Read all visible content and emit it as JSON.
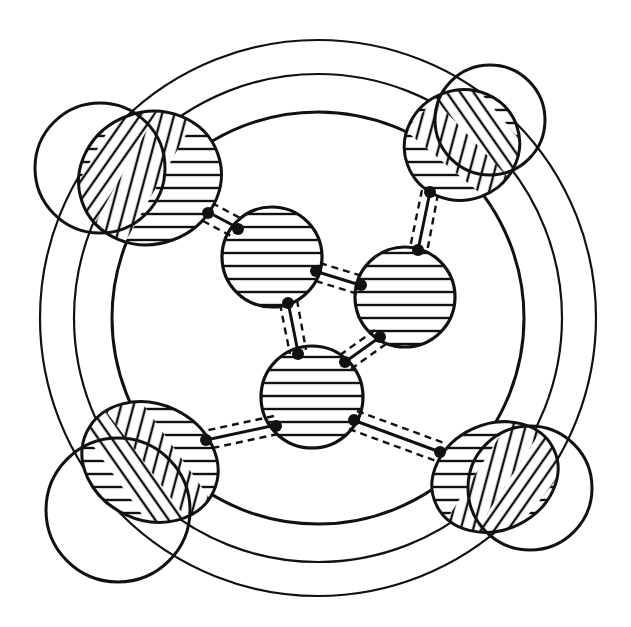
{
  "figure": {
    "description": "Patent-style line drawing: three concentric rings enclosing a cluster of four hatched circles joined by double dashed bonds, with four hatched lobes at the ring's corners",
    "colors": {
      "ink": "#111111",
      "background": "#ffffff"
    },
    "rings": [
      {
        "name": "outer-ring",
        "cx": 318,
        "cy": 318,
        "r": 278
      },
      {
        "name": "middle-ring",
        "cx": 318,
        "cy": 318,
        "r": 244
      },
      {
        "name": "inner-ring",
        "cx": 318,
        "cy": 318,
        "r": 206
      }
    ],
    "core_nodes": [
      {
        "name": "node-upper-left",
        "cx": 272,
        "cy": 257,
        "r": 50
      },
      {
        "name": "node-right",
        "cx": 405,
        "cy": 297,
        "r": 50
      },
      {
        "name": "node-center-bottom",
        "cx": 312,
        "cy": 397,
        "r": 51
      }
    ],
    "lobes": [
      {
        "name": "lobe-top-left",
        "cx": 125,
        "cy": 170
      },
      {
        "name": "lobe-top-right",
        "cx": 475,
        "cy": 133
      },
      {
        "name": "lobe-bottom-left",
        "cx": 130,
        "cy": 490
      },
      {
        "name": "lobe-bottom-right",
        "cx": 510,
        "cy": 485
      }
    ],
    "bond_style": "solid line flanked by dashed lines",
    "text_labels": []
  }
}
